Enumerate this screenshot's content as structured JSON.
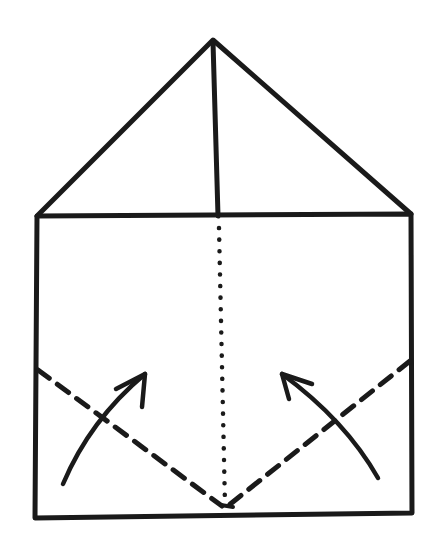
{
  "diagram": {
    "type": "origami-fold-instruction",
    "colors": {
      "ink": "#1a1a1a",
      "paper": "#ffffff"
    },
    "shapes": {
      "triangle_flap": {
        "apex": [
          213,
          40
        ],
        "left": [
          37,
          216
        ],
        "right": [
          411,
          214
        ]
      },
      "center_crease": {
        "from": [
          213,
          40
        ],
        "to": [
          218,
          216
        ],
        "style": "solid"
      },
      "paper_rectangle": {
        "top_left": [
          37,
          216
        ],
        "top_right": [
          411,
          214
        ],
        "bottom_left": [
          35,
          518
        ],
        "bottom_right": [
          412,
          513
        ]
      },
      "center_line": {
        "from": [
          219,
          226
        ],
        "to": [
          225,
          505
        ],
        "style": "dotted",
        "meaning": "center reference line"
      },
      "left_fold_line": {
        "from": [
          37,
          370
        ],
        "to": [
          222,
          505
        ],
        "style": "dashed",
        "meaning": "valley fold"
      },
      "right_fold_line": {
        "from": [
          411,
          360
        ],
        "to": [
          228,
          505
        ],
        "style": "dashed",
        "meaning": "valley fold"
      },
      "left_arrow": {
        "direction": "up-right",
        "meaning": "fold bottom-left corner up"
      },
      "right_arrow": {
        "direction": "up-left",
        "meaning": "fold bottom-right corner up"
      }
    }
  }
}
